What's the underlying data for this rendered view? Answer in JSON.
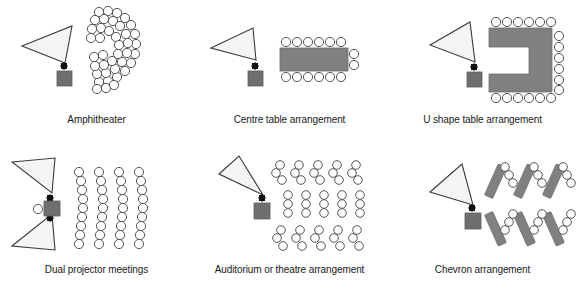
{
  "figure": {
    "title_visible": false,
    "background_color": "#ffffff",
    "columns": 3,
    "rows": 2
  },
  "style": {
    "table_fill": "#808080",
    "table_stroke": "#6e6e6e",
    "beam_fill": "#f4f4f4",
    "beam_stroke": "#3a3a3a",
    "projector_fill": "#111111",
    "screen_fill": "#6f6f6f",
    "seat_fill": "#ffffff",
    "seat_stroke": "#555555",
    "caption_color": "#1a1a1a"
  },
  "panels": [
    {
      "id": "amphitheater",
      "caption": "Amphitheater",
      "icons": {
        "beam": "projection-beam-triangle",
        "projector": "projector-diamond",
        "screen": "screen-square"
      },
      "seating": {
        "layout": "curved-arc",
        "arc_rows": 4,
        "seats_per_arc": [
          9,
          9,
          8,
          7
        ],
        "total_seats": 33,
        "opening_direction": "left"
      }
    },
    {
      "id": "centre-table",
      "caption": "Centre table arrangement",
      "icons": {
        "beam": "projection-beam-triangle",
        "projector": "projector-diamond",
        "screen": "screen-square",
        "table": "rectangular-table"
      },
      "seating": {
        "layout": "around-rectangular-table",
        "seats_top": 6,
        "seats_bottom": 6,
        "seats_right": 2,
        "seats_left": 0,
        "total_seats": 14
      }
    },
    {
      "id": "u-shape-table",
      "caption": "U shape table arrangement",
      "icons": {
        "beam": "projection-beam-triangle",
        "projector": "projector-diamond",
        "screen": "screen-square",
        "table": "u-shaped-table"
      },
      "seating": {
        "layout": "around-u-table",
        "seats_top": 6,
        "seats_bottom": 6,
        "seats_right": 6,
        "total_seats": 18,
        "opening_direction": "left"
      }
    },
    {
      "id": "dual-projector",
      "caption": "Dual projector meetings",
      "icons": {
        "beam_top": "projection-beam-triangle",
        "beam_bottom": "projection-beam-triangle",
        "projector_top": "projector-diamond",
        "projector_bottom": "projector-diamond",
        "screen": "screen-square",
        "side_seat": "presenter-seat-circle"
      },
      "seating": {
        "layout": "vertical-columns",
        "columns": 4,
        "seats_per_column": [
          9,
          9,
          9,
          9
        ],
        "total_seats": 36
      }
    },
    {
      "id": "auditorium",
      "caption": "Auditorium or theatre arrangement",
      "icons": {
        "beam": "projection-beam-triangle",
        "projector": "projector-diamond",
        "screen": "screen-square"
      },
      "seating": {
        "layout": "three-blocks-diagonal",
        "blocks": 3,
        "groups_per_block": 5,
        "seats_per_group": 3,
        "total_seats": 45
      }
    },
    {
      "id": "chevron",
      "caption": "Chevron arrangement",
      "icons": {
        "beam": "projection-beam-triangle",
        "projector": "projector-diamond",
        "screen": "screen-square",
        "table": "angled-chevron-table"
      },
      "seating": {
        "layout": "angled-tables-two-rows",
        "tables_top_row": 3,
        "tables_bottom_row": 3,
        "seats_per_table": 3,
        "total_tables": 6,
        "total_seats": 18
      }
    }
  ]
}
